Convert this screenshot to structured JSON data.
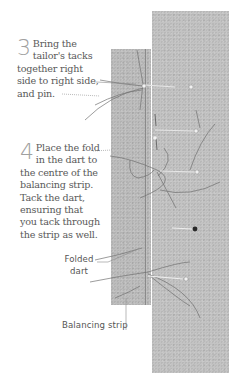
{
  "steps": [
    {
      "number": "3",
      "text": "Bring the tailor's tacks together right side to right side, and pin."
    },
    {
      "number": "4",
      "text": "Place the fold in the dart to the centre of the balancing strip. Tack the dart, ensuring that you tack through the strip as well."
    }
  ],
  "labels": {
    "folded_dart_line1": "Folded",
    "folded_dart_line2": "dart",
    "balancing_strip": "Balancing strip"
  },
  "colors": {
    "fabric": "#c3c3c3",
    "text": "#595959",
    "numeral": "#a0a0a0"
  }
}
